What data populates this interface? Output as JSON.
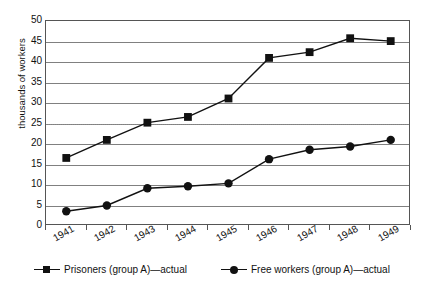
{
  "chart_data": {
    "type": "line",
    "title": "",
    "xlabel": "",
    "ylabel": "thousands of workers",
    "categories": [
      "1941",
      "1942",
      "1943",
      "1944",
      "1945",
      "1946",
      "1947",
      "1948",
      "1949"
    ],
    "ylim": [
      0,
      50
    ],
    "yticks": [
      0,
      5,
      10,
      15,
      20,
      25,
      30,
      35,
      40,
      45,
      50
    ],
    "grid": true,
    "grid_axis": "y",
    "reference_lines": [
      {
        "value": 25,
        "style": "dotted",
        "orientation": "horizontal"
      }
    ],
    "legend_position": "bottom",
    "series": [
      {
        "name": "Prisoners (group A)—actual",
        "marker": "square",
        "color": "#111111",
        "values": [
          16.6,
          21.0,
          25.2,
          26.6,
          31.1,
          41.0,
          42.4,
          45.8,
          45.1
        ]
      },
      {
        "name": "Free workers (group A)—actual",
        "marker": "circle",
        "color": "#111111",
        "values": [
          3.6,
          5.0,
          9.2,
          9.7,
          10.4,
          16.3,
          18.6,
          19.4,
          21.0
        ]
      }
    ]
  },
  "axis": {
    "y_title": "thousands of workers",
    "y_tick_labels": [
      "50",
      "45",
      "40",
      "35",
      "30",
      "25",
      "20",
      "15",
      "10",
      "5",
      "0"
    ],
    "x_tick_labels": [
      "1941",
      "1942",
      "1943",
      "1944",
      "1945",
      "1946",
      "1947",
      "1948",
      "1949"
    ]
  },
  "legend": {
    "items": [
      {
        "label": "Prisoners (group A)—actual",
        "marker": "square-marker-icon"
      },
      {
        "label": "Free workers (group A)—actual",
        "marker": "circle-marker-icon"
      }
    ]
  }
}
